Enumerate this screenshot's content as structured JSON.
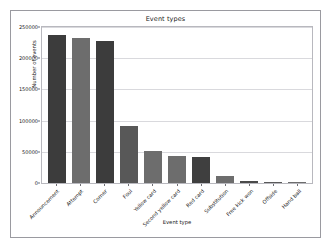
{
  "chart_data": {
    "type": "bar",
    "title": "Event types",
    "xlabel": "Event type",
    "ylabel": "Number of events",
    "categories": [
      "Announcement",
      "Attempt",
      "Corner",
      "Foul",
      "Yellow card",
      "Second yellow card",
      "Red card",
      "Substitution",
      "Free kick won",
      "Offside",
      "Hand ball"
    ],
    "values": [
      238000,
      232000,
      228000,
      92000,
      52000,
      44000,
      41000,
      11000,
      3000,
      1500,
      500
    ],
    "ylim": [
      0,
      250000
    ],
    "yticks": [
      0,
      50000,
      100000,
      150000,
      200000,
      250000
    ],
    "ytick_labels": [
      "0",
      "50000",
      "100000",
      "150000",
      "200000",
      "250000"
    ],
    "grid": true,
    "legend": "none",
    "bar_colors": [
      "#3c3c3c",
      "#6d6d6d",
      "#3c3c3c",
      "#585858",
      "#6d6d6d",
      "#6d6d6d",
      "#3f3f3f",
      "#6d6d6d",
      "#4a4a4a",
      "#5a5a5a",
      "#6d6d6d"
    ]
  },
  "figure": {
    "background": "#ffffff",
    "frame_color": "#9a9aa0",
    "grid_color": "#d9d9dd",
    "text_color": "#1a1a1a"
  }
}
